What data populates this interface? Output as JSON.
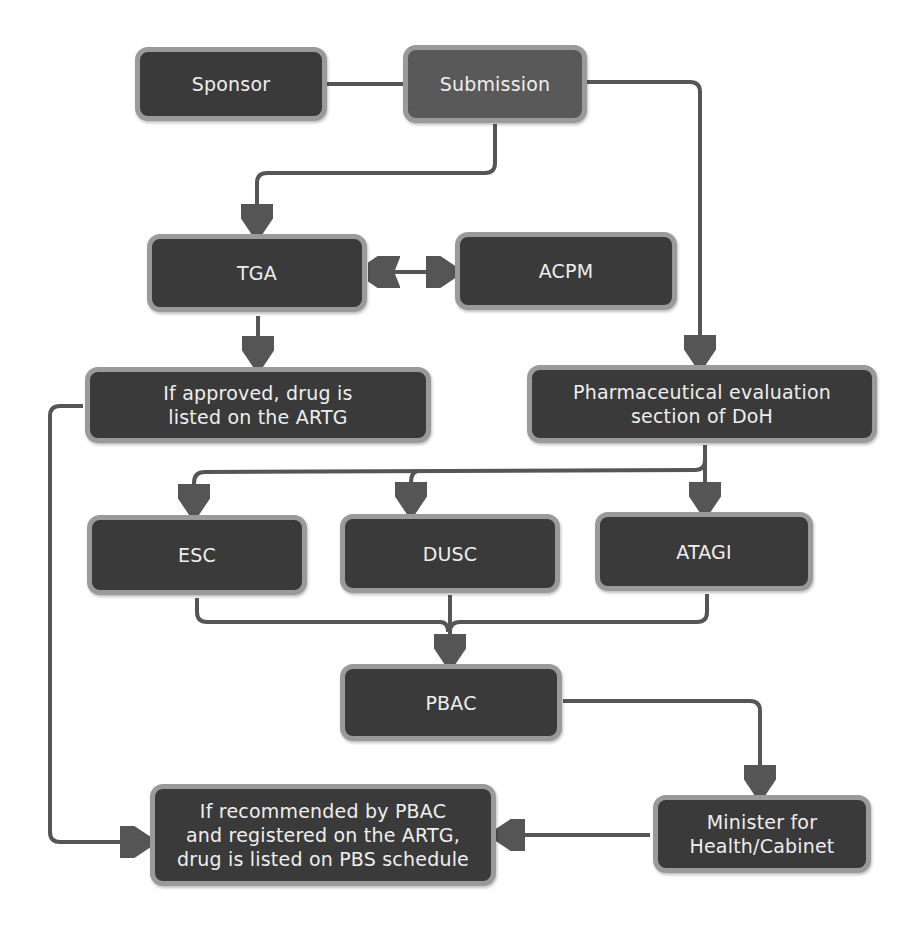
{
  "diagram": {
    "title": "",
    "colors": {
      "node_fill": "#3a3a3a",
      "node_fill_highlight": "#595959",
      "node_border": "#9a9a9a",
      "node_text": "#eeeeee",
      "edge": "#555555",
      "background": "#ffffff"
    },
    "nodes": {
      "sponsor": {
        "label": "Sponsor"
      },
      "submission": {
        "label": "Submission"
      },
      "tga": {
        "label": "TGA"
      },
      "acpm": {
        "label": "ACPM"
      },
      "artg_listing": {
        "label": "If approved, drug is\nlisted on the ARTG"
      },
      "pharma_eval": {
        "label": "Pharmaceutical evaluation\nsection of DoH"
      },
      "esc": {
        "label": "ESC"
      },
      "dusc": {
        "label": "DUSC"
      },
      "atagi": {
        "label": "ATAGI"
      },
      "pbac": {
        "label": "PBAC"
      },
      "minister": {
        "label": "Minister for\nHealth/Cabinet"
      },
      "pbs_listing": {
        "label": "If recommended by PBAC\nand registered on the ARTG,\ndrug is listed on PBS schedule"
      }
    },
    "edges": [
      {
        "from": "Sponsor",
        "to": "Submission",
        "type": "line"
      },
      {
        "from": "Submission",
        "to": "TGA",
        "type": "arrow"
      },
      {
        "from": "Submission",
        "to": "Pharmaceutical evaluation section of DoH",
        "type": "arrow"
      },
      {
        "from": "TGA",
        "to": "ACPM",
        "type": "bidirectional"
      },
      {
        "from": "TGA",
        "to": "If approved, drug is listed on the ARTG",
        "type": "arrow"
      },
      {
        "from": "Pharmaceutical evaluation section of DoH",
        "to": "ESC",
        "type": "arrow"
      },
      {
        "from": "Pharmaceutical evaluation section of DoH",
        "to": "DUSC",
        "type": "arrow"
      },
      {
        "from": "Pharmaceutical evaluation section of DoH",
        "to": "ATAGI",
        "type": "arrow"
      },
      {
        "from": "ESC",
        "to": "PBAC",
        "type": "arrow"
      },
      {
        "from": "DUSC",
        "to": "PBAC",
        "type": "arrow"
      },
      {
        "from": "ATAGI",
        "to": "PBAC",
        "type": "arrow"
      },
      {
        "from": "PBAC",
        "to": "Minister for Health/Cabinet",
        "type": "arrow"
      },
      {
        "from": "Minister for Health/Cabinet",
        "to": "If recommended by PBAC and registered on the ARTG, drug is listed on PBS schedule",
        "type": "arrow"
      },
      {
        "from": "If approved, drug is listed on the ARTG",
        "to": "If recommended by PBAC and registered on the ARTG, drug is listed on PBS schedule",
        "type": "arrow"
      }
    ]
  }
}
